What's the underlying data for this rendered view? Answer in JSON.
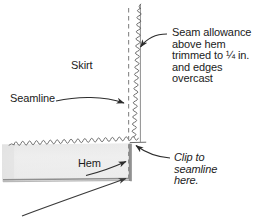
{
  "figure": {
    "width": 254,
    "height": 223,
    "background_color": "#ffffff",
    "line_color": "#4a4a4a",
    "dark_line_color": "#2d2d2d",
    "text_color": "#1b1b1b",
    "hem_fill_color": "#ececec",
    "hem_edge_color": "#9a9a9a"
  },
  "labels": {
    "skirt": "Skirt",
    "seamline": "Seamline",
    "hem": "Hem",
    "seam_allowance": "Seam allowance\nabove hem\ntrimmed to ¼ in.\nand edges\novercast",
    "clip": "Clip to\nseamline\nhere."
  },
  "parts": {
    "seamline_dashes": "vertical-dashed-seamline",
    "overcast_edge_vertical": "zigzag-overcast-seam-edge",
    "overcast_edge_hem": "scalloped-overcast-hem-edge",
    "hem_panel": "hem-fabric-panel",
    "skirt_panel": "skirt-fabric-panel"
  },
  "annotations": {
    "arrow_seamline": "curved-arrow-pointing-right-to-seamline",
    "arrow_seam_allowance": "curved-arrow-pointing-left-to-overcast-edge",
    "arrow_clip": "curved-arrow-pointing-upleft-to-clip-corner",
    "arrow_hem": "diagonal-arrow-pointing-upright-to-hem-fold",
    "arrow_hem_lower": "long-curved-arrow-from-lower-left-to-hem-fold"
  }
}
